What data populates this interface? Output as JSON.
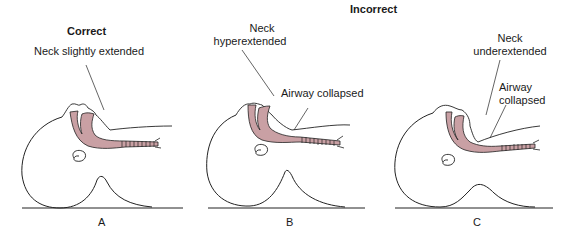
{
  "headings": {
    "correct": "Correct",
    "incorrect": "Incorrect"
  },
  "panels": [
    {
      "letter": "A",
      "labels": [
        "Neck slightly extended"
      ]
    },
    {
      "letter": "B",
      "labels": [
        "Neck",
        "hyperextended",
        "Airway collapsed"
      ]
    },
    {
      "letter": "C",
      "labels": [
        "Neck",
        "underextended",
        "Airway",
        "collapsed"
      ]
    }
  ],
  "colors": {
    "airway_fill": "#c9a0a4",
    "line": "#222222",
    "background": "#ffffff"
  }
}
